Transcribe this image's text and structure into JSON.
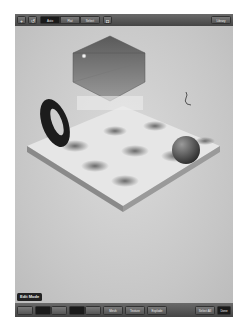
{
  "top_toolbar": {
    "add_label": "+",
    "undo_label": "↺",
    "mode_tabs": [
      {
        "label": "Auto",
        "selected": true
      },
      {
        "label": "Flat",
        "selected": false
      },
      {
        "label": "Select",
        "selected": false
      }
    ],
    "camera_label": "◘",
    "library_label": "Library"
  },
  "scene": {
    "objects": [
      "hexagonal-prism",
      "torus",
      "sphere",
      "terrain-plane",
      "light",
      "camera-figure"
    ],
    "colors": {
      "background": "#cfcfcf",
      "torus": "#1c1c1c",
      "prism": "#6e6e6e",
      "sphere": "#5a5a5a"
    }
  },
  "mode_label": "Edit Mode",
  "bottom_toolbar": {
    "buttons": [
      {
        "label": "",
        "name": "tool-1"
      },
      {
        "label": "",
        "name": "tool-2"
      },
      {
        "label": "",
        "name": "tool-3"
      },
      {
        "label": "",
        "name": "tool-4"
      },
      {
        "label": "",
        "name": "tool-5"
      },
      {
        "label": "Mesh",
        "name": "mesh"
      },
      {
        "label": "Texture",
        "name": "texture"
      },
      {
        "label": "Explode",
        "name": "explode"
      }
    ],
    "select_all_label": "Select All",
    "done_label": "Done"
  }
}
